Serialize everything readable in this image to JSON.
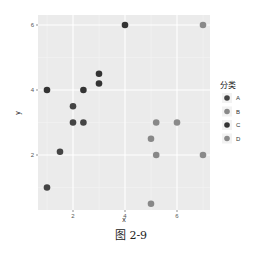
{
  "chart_data": {
    "type": "scatter",
    "title": "",
    "xlabel": "x",
    "ylabel": "y",
    "xlim": [
      0.8,
      7.3
    ],
    "ylim": [
      0.2,
      6.3
    ],
    "xticks": [
      2,
      4,
      6
    ],
    "yticks": [
      2,
      4,
      6
    ],
    "grid": true,
    "legend_position": "right",
    "legend_title": "分类",
    "series": [
      {
        "name": "A",
        "color": "#444444",
        "points": [
          [
            1,
            1
          ],
          [
            1.5,
            2.1
          ],
          [
            2,
            3
          ],
          [
            2,
            3.5
          ],
          [
            2.4,
            3
          ]
        ]
      },
      {
        "name": "B",
        "color": "#888888",
        "points": [
          [
            5,
            0.5
          ],
          [
            5,
            2.5
          ],
          [
            5.2,
            2
          ],
          [
            5.2,
            3
          ]
        ]
      },
      {
        "name": "C",
        "color": "#333333",
        "points": [
          [
            1,
            4
          ],
          [
            2.4,
            4
          ],
          [
            3,
            4.2
          ],
          [
            3,
            4.5
          ],
          [
            4,
            6
          ]
        ]
      },
      {
        "name": "D",
        "color": "#8a8a8a",
        "points": [
          [
            6,
            3
          ],
          [
            7,
            2
          ],
          [
            7,
            6
          ]
        ]
      }
    ]
  },
  "axis": {
    "x_title": "x",
    "y_title": "y",
    "x_ticks": [
      "2",
      "4",
      "6"
    ],
    "y_ticks": [
      "2",
      "4",
      "6"
    ]
  },
  "legend": {
    "title": "分类",
    "items": [
      {
        "label": "A",
        "color": "#444444"
      },
      {
        "label": "B",
        "color": "#888888"
      },
      {
        "label": "C",
        "color": "#333333"
      },
      {
        "label": "D",
        "color": "#8a8a8a"
      }
    ]
  },
  "caption": "图 2-9"
}
